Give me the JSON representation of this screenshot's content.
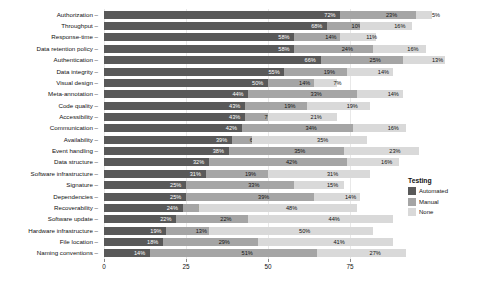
{
  "chart_data": {
    "type": "bar",
    "orientation": "horizontal",
    "stacked": true,
    "title": "",
    "xlabel": "",
    "ylabel": "",
    "xlim": [
      0,
      103
    ],
    "xticks": [
      0,
      25,
      50,
      75
    ],
    "grid": true,
    "legend": {
      "title": "Testing",
      "position": "right",
      "entries": [
        {
          "name": "Automated",
          "color": "#595959"
        },
        {
          "name": "Manual",
          "color": "#a5a5a5"
        },
        {
          "name": "None",
          "color": "#d9d9d9"
        }
      ]
    },
    "categories": [
      "Authorization",
      "Throughput",
      "Response-time",
      "Data retention policy",
      "Authentication",
      "Data integrity",
      "Visual design",
      "Meta-annotation",
      "Code quality",
      "Accessibility",
      "Communication",
      "Availability",
      "Event handling",
      "Data structure",
      "Software infrastructure",
      "Signature",
      "Dependencies",
      "Recoverability",
      "Software update",
      "Hardware infrastructure",
      "File location",
      "Naming conventions"
    ],
    "series": [
      {
        "name": "Automated",
        "color": "#595959",
        "values": [
          72,
          68,
          58,
          58,
          66,
          55,
          50,
          44,
          43,
          43,
          42,
          39,
          38,
          32,
          31,
          25,
          25,
          24,
          22,
          19,
          18,
          14
        ]
      },
      {
        "name": "Manual",
        "color": "#a5a5a5",
        "values": [
          23,
          10,
          14,
          24,
          25,
          19,
          14,
          33,
          19,
          7,
          34,
          6,
          35,
          42,
          19,
          33,
          39,
          5,
          22,
          13,
          29,
          51
        ]
      },
      {
        "name": "None",
        "color": "#d9d9d9",
        "values": [
          5,
          16,
          11,
          16,
          13,
          14,
          7,
          14,
          19,
          21,
          16,
          35,
          23,
          16,
          31,
          15,
          14,
          48,
          44,
          50,
          41,
          27
        ]
      }
    ],
    "labels": {
      "Authorization": [
        "72%",
        "23%",
        "5%"
      ],
      "Throughput": [
        "68%",
        "10%",
        "16%"
      ],
      "Response-time": [
        "58%",
        "14%",
        "11%"
      ],
      "Data retention policy": [
        "58%",
        "24%",
        "16%"
      ],
      "Authentication": [
        "66%",
        "25%",
        "13%"
      ],
      "Data integrity": [
        "55%",
        "19%",
        "14%"
      ],
      "Visual design": [
        "50%",
        "14%",
        "7%"
      ],
      "Meta-annotation": [
        "44%",
        "33%",
        "14%"
      ],
      "Code quality": [
        "43%",
        "19%",
        "19%"
      ],
      "Accessibility": [
        "43%",
        "7%",
        "21%"
      ],
      "Communication": [
        "42%",
        "34%",
        "16%"
      ],
      "Availability": [
        "39%",
        "6%",
        "35%"
      ],
      "Event handling": [
        "38%",
        "35%",
        "23%"
      ],
      "Data structure": [
        "32%",
        "42%",
        "16%"
      ],
      "Software infrastructure": [
        "31%",
        "19%",
        "31%"
      ],
      "Signature": [
        "25%",
        "33%",
        "15%"
      ],
      "Dependencies": [
        "25%",
        "39%",
        "14%"
      ],
      "Recoverability": [
        "24%",
        "5%",
        "48%"
      ],
      "Software update": [
        "22%",
        "22%",
        "44%"
      ],
      "Hardware infrastructure": [
        "19%",
        "13%",
        "50%"
      ],
      "File location": [
        "18%",
        "29%",
        "41%"
      ],
      "Naming conventions": [
        "14%",
        "51%",
        "27%"
      ]
    }
  }
}
